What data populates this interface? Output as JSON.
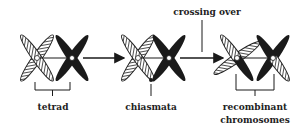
{
  "diagram": {
    "stages": [
      {
        "id": "tetrad",
        "label": "tetrad"
      },
      {
        "id": "chiasmata",
        "label": "chiasmata"
      },
      {
        "id": "recombinant",
        "label_line1": "recombinant",
        "label_line2": "chromosomes"
      }
    ],
    "annotations": {
      "crossing_over": "crossing over"
    },
    "colors": {
      "dark_chromosome": "#1a1a1a",
      "hatched_chromosome_outline": "#222222",
      "hatch_fill": "#ffffff",
      "line": "#1a1a1a"
    }
  }
}
